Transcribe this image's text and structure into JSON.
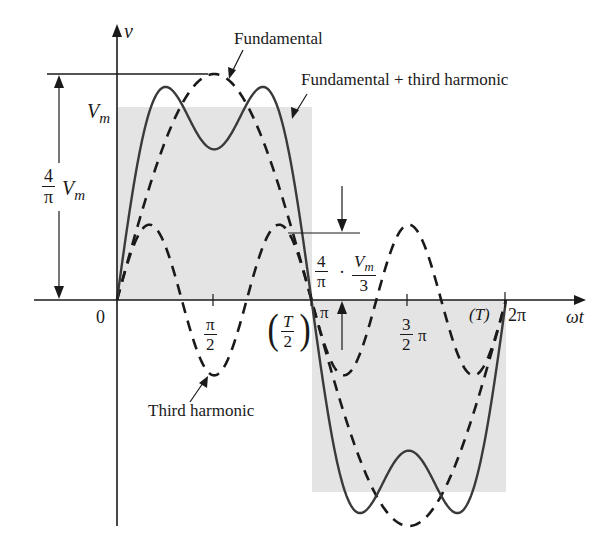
{
  "figure": {
    "background_color": "#ffffff",
    "shade_color": "#e4e4e4",
    "line_color": "#333333",
    "axis_color": "#1a1a1a"
  },
  "axes": {
    "y_label": "v",
    "x_label": "ωt",
    "origin_label": "0",
    "ticks": [
      {
        "label_num": "π",
        "label_den": "2",
        "pos": "π/2"
      },
      {
        "label": "π",
        "pos": "π"
      },
      {
        "label_num": "3",
        "label_den": "2",
        "suffix": "π",
        "pos": "3π/2"
      },
      {
        "label": "2π",
        "pos": "2π"
      }
    ],
    "period_labels": {
      "half_period_num": "T",
      "half_period_den": "2",
      "full_period": "(T)"
    }
  },
  "annotations": {
    "fundamental": "Fundamental",
    "fundamental_plus_third": "Fundamental + third harmonic",
    "third_harmonic": "Third harmonic",
    "vm": "V",
    "vm_sub": "m",
    "fund_amplitude_num": "4",
    "fund_amplitude_den": "π",
    "fund_amplitude_suffix": "V",
    "fund_amplitude_suffix_sub": "m",
    "third_amplitude_num1": "4",
    "third_amplitude_den1": "π",
    "third_amplitude_dot": "·",
    "third_amplitude_num2": "V",
    "third_amplitude_num2_sub": "m",
    "third_amplitude_den2": "3"
  },
  "curves": {
    "square_wave": {
      "style": "shaded",
      "amplitude": "Vm"
    },
    "fundamental": {
      "style": "dashed",
      "amplitude": "4Vm/π"
    },
    "third_harmonic": {
      "style": "dashed",
      "amplitude": "4Vm/(3π)"
    },
    "sum": {
      "style": "solid",
      "description": "Fundamental + third harmonic"
    }
  }
}
